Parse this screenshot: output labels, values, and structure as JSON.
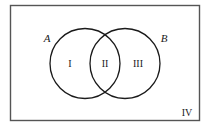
{
  "figure": {
    "type": "venn-diagram",
    "background_color": "#ffffff",
    "stroke_color": "#1a1a1a",
    "border_color": "#555555"
  },
  "universal_set": {
    "label": "IV",
    "description": "rectangle representing the universal set",
    "x": 10,
    "y": 5,
    "width": 190,
    "height": 116
  },
  "sets": [
    {
      "id": "A",
      "label": "A",
      "cx": 85,
      "cy": 63.5,
      "r": 35
    },
    {
      "id": "B",
      "label": "B",
      "cx": 125,
      "cy": 63.5,
      "r": 35
    }
  ],
  "regions": [
    {
      "id": "I",
      "label": "I",
      "meaning": "A only",
      "x": 70,
      "y": 67
    },
    {
      "id": "II",
      "label": "II",
      "meaning": "A intersect B",
      "x": 105,
      "y": 67
    },
    {
      "id": "III",
      "label": "III",
      "meaning": "B only",
      "x": 138,
      "y": 67
    },
    {
      "id": "IV",
      "label": "IV",
      "meaning": "outside A and B",
      "x": 187,
      "y": 116
    }
  ],
  "set_labels": [
    {
      "id": "A",
      "label": "A",
      "x": 47,
      "y": 42
    },
    {
      "id": "B",
      "label": "B",
      "x": 164,
      "y": 42
    }
  ]
}
